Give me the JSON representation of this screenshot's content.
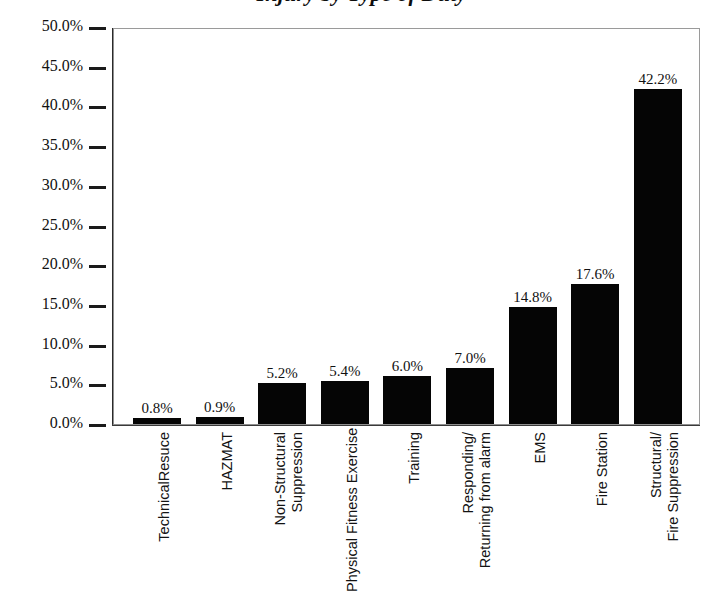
{
  "chart_data": {
    "type": "bar",
    "title": "Injury by Type of Duty",
    "title_note": "title-cropped-at-top-edge",
    "xlabel": "",
    "ylabel": "",
    "ylim": [
      0,
      50
    ],
    "ytick_step": 5,
    "grid": false,
    "legend": false,
    "bar_color": "#050505",
    "categories": [
      "TechnicalResuce",
      "HAZMAT",
      "Non-Structural Suppression",
      "Physical Fitness Exercise",
      "Training",
      "Responding/ Returning from alarm",
      "EMS",
      "Fire Station",
      "Structural/ Fire Suppression"
    ],
    "category_lines": [
      [
        "TechnicalResuce"
      ],
      [
        "HAZMAT"
      ],
      [
        "Non-Structural",
        "Suppression"
      ],
      [
        "Physical Fitness Exercise"
      ],
      [
        "Training"
      ],
      [
        "Responding/",
        "Returning from alarm"
      ],
      [
        "EMS"
      ],
      [
        "Fire Station"
      ],
      [
        "Structural/",
        "Fire Suppression"
      ]
    ],
    "values": [
      0.8,
      0.9,
      5.2,
      5.4,
      6.0,
      7.0,
      14.8,
      17.6,
      42.2
    ],
    "value_labels": [
      "0.8%",
      "0.9%",
      "5.2%",
      "5.4%",
      "6.0%",
      "7.0%",
      "14.8%",
      "17.6%",
      "42.2%"
    ],
    "ytick_labels": [
      "50.0%",
      "45.0%",
      "40.0%",
      "35.0%",
      "30.0%",
      "25.0%",
      "20.0%",
      "15.0%",
      "10.0%",
      "5.0%",
      "0.0%"
    ],
    "ytick_values": [
      50,
      45,
      40,
      35,
      30,
      25,
      20,
      15,
      10,
      5,
      0
    ]
  }
}
